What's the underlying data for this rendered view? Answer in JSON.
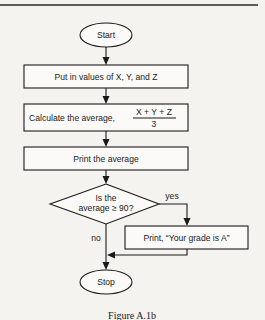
{
  "flowchart": {
    "start": {
      "label": "Start"
    },
    "step_input": {
      "label": "Put in values of X, Y, and Z"
    },
    "step_calculate": {
      "label": "Calculate the average,",
      "formula_numerator": "X + Y + Z",
      "formula_denominator": "3"
    },
    "step_print_average": {
      "label": "Print the average"
    },
    "decision": {
      "line1": "Is the",
      "line2": "average ≥ 90?",
      "yes_label": "yes",
      "no_label": "no"
    },
    "step_print_grade": {
      "label": "Print, “Your grade is A”"
    },
    "stop": {
      "label": "Stop"
    }
  },
  "caption": "Figure A.1b",
  "colors": {
    "ink": "#1a1a1a",
    "paper": "#f4f3f0"
  }
}
